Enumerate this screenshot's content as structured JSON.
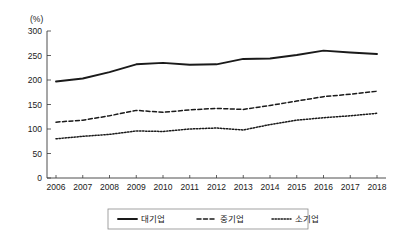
{
  "chart_data": {
    "type": "line",
    "title": "",
    "xlabel": "",
    "ylabel": "(%)",
    "unit_label": "(%)",
    "categories": [
      "2006",
      "2007",
      "2008",
      "2009",
      "2010",
      "2011",
      "2012",
      "2013",
      "2014",
      "2015",
      "2016",
      "2017",
      "2018"
    ],
    "x": [
      2006,
      2007,
      2008,
      2009,
      2010,
      2011,
      2012,
      2013,
      2014,
      2015,
      2016,
      2017,
      2018
    ],
    "ylim": [
      0,
      300
    ],
    "yticks": [
      0,
      50,
      100,
      150,
      200,
      250,
      300
    ],
    "ytick_labels": [
      "0",
      "50",
      "100",
      "150",
      "200",
      "250",
      "300"
    ],
    "grid": false,
    "legend_position": "bottom",
    "series": [
      {
        "name": "대기업",
        "style": "solid",
        "color": "#1a1a1a",
        "values": [
          197,
          203,
          216,
          232,
          235,
          231,
          232,
          243,
          244,
          251,
          260,
          256,
          253
        ]
      },
      {
        "name": "중기업",
        "style": "dashed",
        "color": "#1a1a1a",
        "values": [
          114,
          118,
          127,
          138,
          134,
          139,
          142,
          140,
          148,
          157,
          166,
          171,
          177
        ]
      },
      {
        "name": "소기업",
        "style": "dotted",
        "color": "#1a1a1a",
        "values": [
          80,
          85,
          89,
          96,
          95,
          100,
          102,
          98,
          109,
          118,
          123,
          127,
          132
        ]
      }
    ]
  },
  "legend": {
    "entries": [
      {
        "label": "대기업",
        "style": "solid"
      },
      {
        "label": "중기업",
        "style": "dashed"
      },
      {
        "label": "소기업",
        "style": "dotted"
      }
    ]
  }
}
